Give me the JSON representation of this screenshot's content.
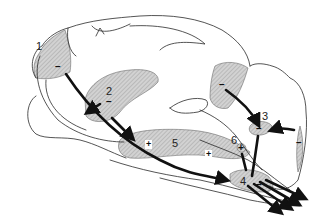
{
  "diagram": {
    "type": "sagittal brain schematic",
    "colors": {
      "outline": "#2a2a2a",
      "shading": "#bcbcbc",
      "arrows": "#111111"
    },
    "regions": [
      {
        "id": "1",
        "label": "1",
        "sign": "–"
      },
      {
        "id": "2",
        "label": "2",
        "sign": "–"
      },
      {
        "id": "3",
        "label": "3",
        "sign": "–"
      },
      {
        "id": "4",
        "label": "4",
        "sign": "–"
      },
      {
        "id": "5",
        "label": "5",
        "signs": [
          "+",
          "+",
          "+"
        ]
      },
      {
        "id": "6",
        "label": "6",
        "sign": "+"
      }
    ],
    "extra_signs": {
      "occipital": "–",
      "cerebellar": "–"
    }
  }
}
